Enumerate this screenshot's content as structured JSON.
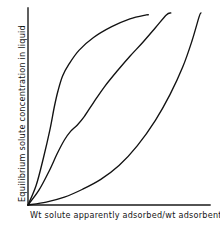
{
  "figure": {
    "background_color": "#ffffff",
    "line_color": "#121212",
    "axis_color": "#1a1a1a"
  },
  "axes": {
    "x_label": "Wt solute apparently adsorbed/wt adsorbent",
    "y_label": "Equilibrium solute concentration in liquid",
    "x_ticks": [],
    "y_ticks": [],
    "grid": false,
    "origin_px": [
      28,
      205
    ],
    "x_axis_end_px": [
      210,
      205
    ],
    "y_axis_end_px": [
      28,
      8
    ]
  },
  "chart_data": {
    "type": "line",
    "title": "",
    "subtitle": "",
    "xlabel": "Wt solute apparently adsorbed/wt adsorbent",
    "ylabel": "Equilibrium solute concentration in liquid",
    "xlim": [
      0,
      1
    ],
    "ylim": [
      0,
      1
    ],
    "grid": false,
    "legend": null,
    "legend_position": "none",
    "annotations": [],
    "note": "Three unlabelled hand-drawn adsorption isotherm curves, all starting at the origin. x and y are in normalized axis fractions (0 = origin, 1 = axis end).",
    "series": [
      {
        "name": "curve-left-favorable",
        "shape": "steep rise then concave-down plateauing (favorable / high-affinity isotherm)",
        "x": [
          0.0,
          0.045,
          0.085,
          0.12,
          0.145,
          0.165,
          0.19,
          0.225,
          0.28,
          0.36,
          0.46,
          0.56,
          0.65,
          0.66
        ],
        "y": [
          0.0,
          0.1,
          0.24,
          0.38,
          0.5,
          0.58,
          0.655,
          0.715,
          0.785,
          0.85,
          0.905,
          0.945,
          0.965,
          0.965
        ]
      },
      {
        "name": "curve-middle-sigmoid",
        "shape": "S-shaped sigmoid with a shoulder near the lower third (stepped / type-S isotherm)",
        "x": [
          0.0,
          0.06,
          0.115,
          0.16,
          0.2,
          0.235,
          0.27,
          0.31,
          0.36,
          0.42,
          0.49,
          0.56,
          0.63,
          0.7,
          0.76,
          0.785
        ],
        "y": [
          0.0,
          0.075,
          0.17,
          0.26,
          0.33,
          0.375,
          0.405,
          0.45,
          0.52,
          0.6,
          0.68,
          0.755,
          0.825,
          0.9,
          0.965,
          0.975
        ]
      },
      {
        "name": "curve-right-unfavorable",
        "shape": "convex upward, slow start then sharply rising (unfavorable / type-III isotherm)",
        "x": [
          0.0,
          0.1,
          0.2,
          0.3,
          0.4,
          0.5,
          0.6,
          0.7,
          0.78,
          0.85,
          0.9,
          0.94,
          0.95
        ],
        "y": [
          0.0,
          0.015,
          0.04,
          0.08,
          0.13,
          0.2,
          0.3,
          0.43,
          0.56,
          0.7,
          0.83,
          0.955,
          0.975
        ]
      }
    ]
  }
}
